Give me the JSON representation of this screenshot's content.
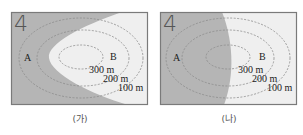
{
  "figures": [
    {
      "id": "ga",
      "caption": "(가)",
      "corner_number": "4",
      "point_a": "A",
      "point_b": "B",
      "contours": [
        "300 m",
        "200 m",
        "100 m"
      ],
      "shading": "darker region on left/outer side, curved boundary bulging left around B"
    },
    {
      "id": "na",
      "caption": "(나)",
      "corner_number": "4",
      "point_a": "A",
      "point_b": "B",
      "contours": [
        "300 m",
        "200 m",
        "100 m"
      ],
      "shading": "darker region on left half, nearly vertical curved boundary through hill center"
    }
  ],
  "colors": {
    "dark_region": "#b5b5b5",
    "light_region": "#efefef",
    "frame": "#7a7a7a",
    "contour": "#8c8c8c"
  }
}
